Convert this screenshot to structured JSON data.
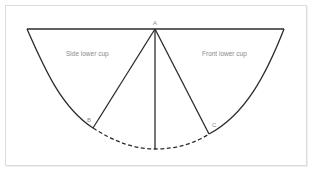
{
  "diagram": {
    "labels": {
      "side_region": "Side lower cup",
      "front_region": "Front lower cup"
    },
    "points": {
      "A": "A",
      "B": "B",
      "C": "C"
    },
    "colors": {
      "line": "#2b2b2b",
      "label": "#8a8a8a",
      "frame": "#dcdcdc"
    },
    "line_styles": {
      "outline": "solid",
      "hem_curve_between_B_and_C": "dashed"
    }
  }
}
